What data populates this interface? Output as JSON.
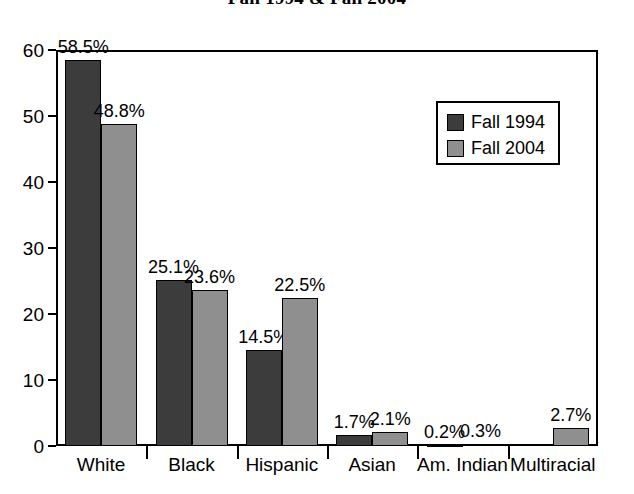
{
  "chart_data": {
    "type": "bar",
    "title": "Fall 1994 & Fall 2004",
    "xlabel": "",
    "ylabel": "",
    "ylim": [
      0,
      60
    ],
    "yticks": [
      0,
      10,
      20,
      30,
      40,
      50,
      60
    ],
    "ytick_labels": [
      "0",
      "10",
      "20",
      "30",
      "40",
      "50",
      "60"
    ],
    "grid": false,
    "legend_position": "upper right",
    "categories": [
      "White",
      "Black",
      "Hispanic",
      "Asian",
      "Am. Indian",
      "Multiracial"
    ],
    "series": [
      {
        "name": "Fall 1994",
        "color": "#3c3c3c",
        "values": [
          58.5,
          25.1,
          14.5,
          1.7,
          0.2,
          null
        ],
        "labels": [
          "58.5%",
          "25.1%",
          "14.5%",
          "1.7%",
          "0.2%",
          ""
        ]
      },
      {
        "name": "Fall 2004",
        "color": "#8f8f8f",
        "values": [
          48.8,
          23.6,
          22.5,
          2.1,
          0.3,
          2.7
        ],
        "labels": [
          "48.8%",
          "23.6%",
          "22.5%",
          "2.1%",
          "0.3%",
          "2.7%"
        ]
      }
    ]
  },
  "legend": {
    "items": [
      {
        "label": "Fall 1994",
        "color": "#3c3c3c"
      },
      {
        "label": "Fall 2004",
        "color": "#8f8f8f"
      }
    ]
  },
  "colors": {
    "series_1994": "#3c3c3c",
    "series_2004": "#8f8f8f",
    "axis": "#000000",
    "background": "#ffffff"
  }
}
